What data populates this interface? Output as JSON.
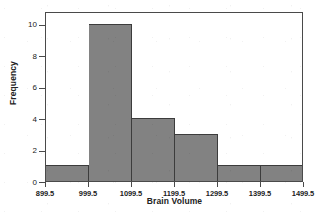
{
  "figure": {
    "title_remnant": "",
    "background_color": "#ffffff",
    "frame_color": "#4a4a4a"
  },
  "chart_data": {
    "type": "bar",
    "title": "",
    "xlabel": "Brain Volume",
    "ylabel": "Frequency",
    "categories": [
      "899.5-999.5",
      "999.5-1099.5",
      "1099.5-1199.5",
      "1199.5-1299.5",
      "1299.5-1399.5",
      "1399.5-1499.5"
    ],
    "bin_edges": [
      899.5,
      999.5,
      1099.5,
      1199.5,
      1299.5,
      1399.5,
      1499.5
    ],
    "values": [
      1,
      10,
      4,
      3,
      1,
      1
    ],
    "xlim": [
      899.5,
      1499.5
    ],
    "ylim": [
      0,
      10.8
    ],
    "xticks": [
      "899.5",
      "999.5",
      "1099.5",
      "1199.5",
      "1299.5",
      "1399.5",
      "1499.5"
    ],
    "xtick_values": [
      899.5,
      999.5,
      1099.5,
      1199.5,
      1299.5,
      1399.5,
      1499.5
    ],
    "yticks": [
      "0",
      "2",
      "4",
      "6",
      "8",
      "10"
    ],
    "ytick_values": [
      0,
      2,
      4,
      6,
      8,
      10
    ],
    "grid": false,
    "legend": false,
    "bar_color": "#828282",
    "bar_edge_color": "#3c3c3c"
  }
}
